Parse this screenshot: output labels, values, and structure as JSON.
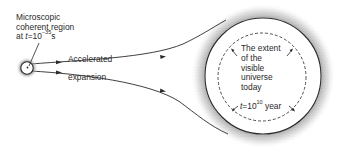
{
  "diagram": {
    "origin_label": {
      "line1": "Microscopic",
      "line2": "coherent region",
      "line3_prefix": "at ",
      "line3_var": "t",
      "line3_eq": "=10",
      "line3_exp": "−35",
      "line3_unit": "s"
    },
    "path_labels": {
      "upper": "Accelerated",
      "lower": "expansion"
    },
    "universe_label": {
      "line1": "The extent",
      "line2": "of the",
      "line3": "visible",
      "line4": "universe",
      "line5": "today"
    },
    "time_label": {
      "var": "t",
      "eq": "=10",
      "exp": "10",
      "unit": " year"
    },
    "colors": {
      "ink": "#2a2a2a",
      "stipple": "#7a7a7a",
      "background": "#ffffff"
    }
  }
}
